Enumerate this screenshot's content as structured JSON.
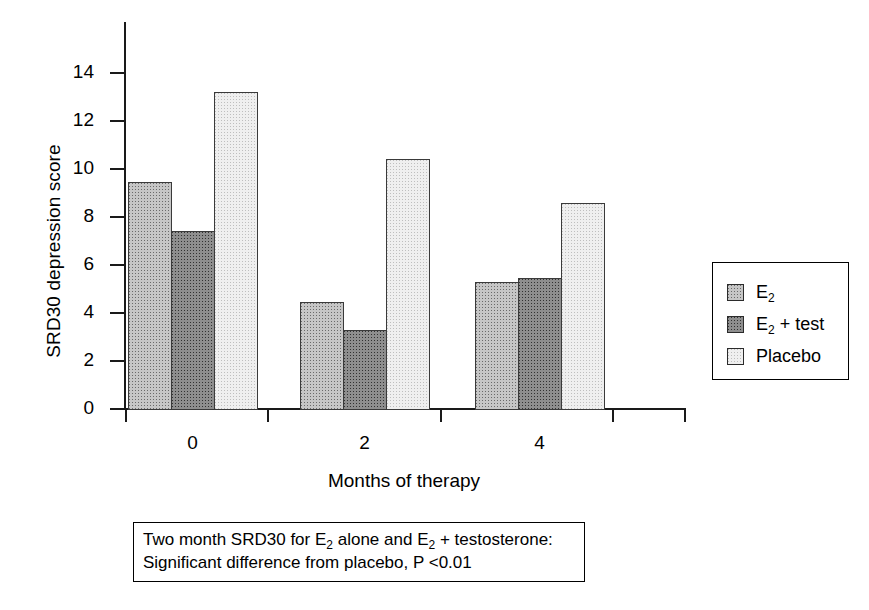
{
  "chart_data": {
    "type": "bar",
    "title": "",
    "xlabel": "Months of therapy",
    "ylabel": "SRD30 depression score",
    "categories": [
      "0",
      "2",
      "4"
    ],
    "ylim": [
      0,
      15
    ],
    "yticks": [
      0,
      2,
      4,
      6,
      8,
      10,
      12,
      14
    ],
    "ytick_labels": [
      "0",
      "2",
      "4",
      "6",
      "8",
      "10",
      "12",
      "14"
    ],
    "grid": false,
    "legend_position": "right",
    "series": [
      {
        "name": "E2",
        "label": "E₂",
        "values": [
          9.45,
          4.45,
          5.3
        ],
        "color": "#c6c6c6"
      },
      {
        "name": "E2 + test",
        "label": "E₂ + test",
        "values": [
          7.4,
          3.3,
          5.45
        ],
        "color": "#8e8e8e"
      },
      {
        "name": "Placebo",
        "label": "Placebo",
        "values": [
          13.2,
          10.4,
          8.6
        ],
        "color": "#efefef"
      }
    ],
    "annotations": [
      "Two month SRD30 for E₂ alone and E₂ + testosterone:",
      "Significant difference from placebo, P <0.01"
    ]
  },
  "axes": {
    "y_title": "SRD30 depression score",
    "x_title": "Months of therapy",
    "y_tick_labels": [
      "14",
      "12",
      "10",
      "8",
      "6",
      "4",
      "2",
      "0"
    ],
    "x_tick_labels": [
      "0",
      "2",
      "4"
    ]
  },
  "legend": {
    "items": [
      {
        "label_main": "E",
        "label_sub": "2",
        "label_tail": "",
        "swatch": "e2-swatch"
      },
      {
        "label_main": "E",
        "label_sub": "2",
        "label_tail": " + test",
        "swatch": "e2-test-swatch"
      },
      {
        "label_main": "Placebo",
        "label_sub": "",
        "label_tail": "",
        "swatch": "placebo-swatch"
      }
    ]
  },
  "caption": {
    "line1_a": "Two month SRD30 for E",
    "line1_sub1": "2",
    "line1_b": " alone and E",
    "line1_sub2": "2",
    "line1_c": " + testosterone:",
    "line2": "Significant difference from placebo, P <0.01"
  }
}
